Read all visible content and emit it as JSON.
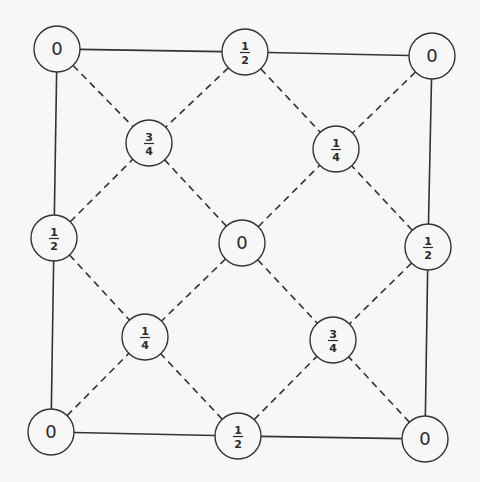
{
  "diagram": {
    "title": "",
    "node_radius": 23,
    "colors": {
      "background": "#f7f7f7",
      "stroke": "#333333",
      "text": "#2a2a2a"
    },
    "nodes": [
      {
        "id": "n-tl",
        "label": "0",
        "num": "",
        "den": "",
        "x": 57,
        "y": 49
      },
      {
        "id": "n-tc",
        "label": "",
        "num": "1",
        "den": "2",
        "x": 245,
        "y": 52
      },
      {
        "id": "n-tr",
        "label": "0",
        "num": "",
        "den": "",
        "x": 432,
        "y": 56
      },
      {
        "id": "n-ul",
        "label": "",
        "num": "3",
        "den": "4",
        "x": 149,
        "y": 143
      },
      {
        "id": "n-ur",
        "label": "",
        "num": "1",
        "den": "4",
        "x": 336,
        "y": 149
      },
      {
        "id": "n-ml",
        "label": "",
        "num": "1",
        "den": "2",
        "x": 54,
        "y": 238
      },
      {
        "id": "n-c",
        "label": "0",
        "num": "",
        "den": "",
        "x": 242,
        "y": 243
      },
      {
        "id": "n-mr",
        "label": "",
        "num": "1",
        "den": "2",
        "x": 428,
        "y": 247
      },
      {
        "id": "n-ll",
        "label": "",
        "num": "1",
        "den": "4",
        "x": 145,
        "y": 337
      },
      {
        "id": "n-lr",
        "label": "",
        "num": "3",
        "den": "4",
        "x": 333,
        "y": 340
      },
      {
        "id": "n-bl",
        "label": "0",
        "num": "",
        "den": "",
        "x": 51,
        "y": 432
      },
      {
        "id": "n-bc",
        "label": "",
        "num": "1",
        "den": "2",
        "x": 238,
        "y": 436
      },
      {
        "id": "n-br",
        "label": "0",
        "num": "",
        "den": "",
        "x": 425,
        "y": 439
      }
    ],
    "edges": [
      {
        "from": "n-tl",
        "to": "n-tc",
        "style": "solid"
      },
      {
        "from": "n-tc",
        "to": "n-tr",
        "style": "solid"
      },
      {
        "from": "n-tl",
        "to": "n-ml",
        "style": "solid"
      },
      {
        "from": "n-ml",
        "to": "n-bl",
        "style": "solid"
      },
      {
        "from": "n-tr",
        "to": "n-mr",
        "style": "solid"
      },
      {
        "from": "n-mr",
        "to": "n-br",
        "style": "solid"
      },
      {
        "from": "n-bl",
        "to": "n-bc",
        "style": "solid"
      },
      {
        "from": "n-bc",
        "to": "n-br",
        "style": "solid"
      },
      {
        "from": "n-tl",
        "to": "n-ul",
        "style": "dashed"
      },
      {
        "from": "n-tc",
        "to": "n-ul",
        "style": "dashed"
      },
      {
        "from": "n-ml",
        "to": "n-ul",
        "style": "dashed"
      },
      {
        "from": "n-c",
        "to": "n-ul",
        "style": "dashed"
      },
      {
        "from": "n-tc",
        "to": "n-ur",
        "style": "dashed"
      },
      {
        "from": "n-tr",
        "to": "n-ur",
        "style": "dashed"
      },
      {
        "from": "n-c",
        "to": "n-ur",
        "style": "dashed"
      },
      {
        "from": "n-mr",
        "to": "n-ur",
        "style": "dashed"
      },
      {
        "from": "n-ml",
        "to": "n-ll",
        "style": "dashed"
      },
      {
        "from": "n-c",
        "to": "n-ll",
        "style": "dashed"
      },
      {
        "from": "n-bl",
        "to": "n-ll",
        "style": "dashed"
      },
      {
        "from": "n-bc",
        "to": "n-ll",
        "style": "dashed"
      },
      {
        "from": "n-c",
        "to": "n-lr",
        "style": "dashed"
      },
      {
        "from": "n-mr",
        "to": "n-lr",
        "style": "dashed"
      },
      {
        "from": "n-bc",
        "to": "n-lr",
        "style": "dashed"
      },
      {
        "from": "n-br",
        "to": "n-lr",
        "style": "dashed"
      }
    ]
  }
}
